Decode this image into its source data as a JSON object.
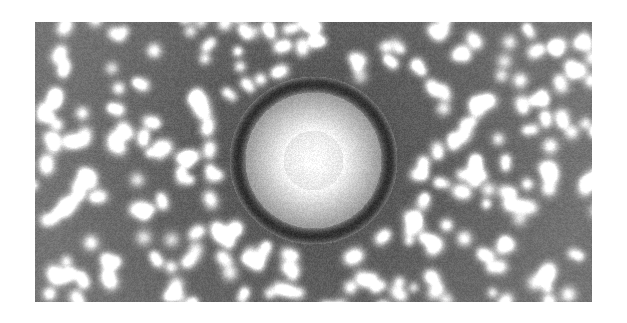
{
  "page": {
    "background_color": "#ffffff",
    "width": 627,
    "height": 323
  },
  "figure": {
    "kind": "scanning-probe-micrograph",
    "modality": "grayscale-topography",
    "frame": {
      "left": 35,
      "top": 22,
      "width": 557,
      "height": 280,
      "border": "none"
    },
    "palette": {
      "background_mean": "#6b6b6b",
      "lattice_dark": "#4a4a4a",
      "lattice_light": "#8d8d8d",
      "core_highlight": "#fdfdfd",
      "ring_dark": "#141414",
      "adatom_bright": "#f0f0f0",
      "page_white": "#ffffff"
    },
    "structure": {
      "center_x": 313,
      "center_y": 160,
      "core_radius": 30,
      "inner_terrace_radius": 62,
      "dark_ring_inner_radius": 68,
      "dark_ring_outer_radius": 84,
      "lattice_spacing": 7.4,
      "radial_rows": 96,
      "adatom_count": 430,
      "noise_amplitude": 0.1
    }
  }
}
